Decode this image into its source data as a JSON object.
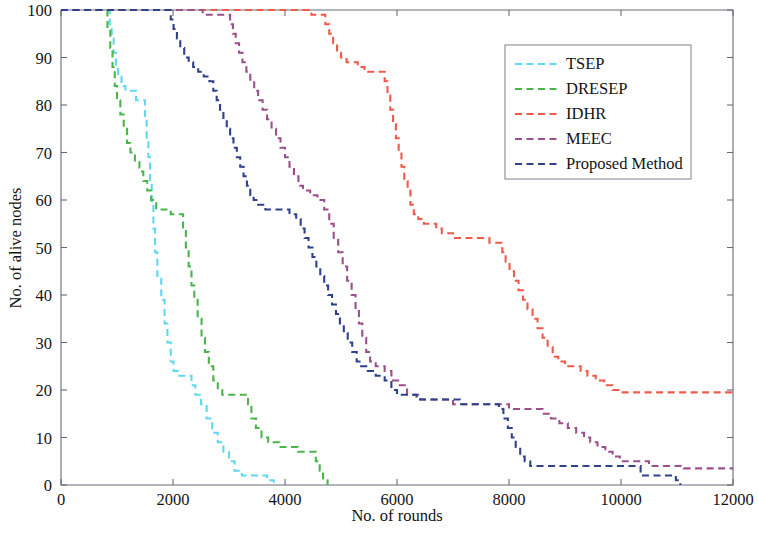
{
  "chart_data": {
    "type": "line",
    "title": "",
    "xlabel": "No. of rounds",
    "ylabel": "No. of alive nodes",
    "xlim": [
      0,
      12000
    ],
    "ylim": [
      0,
      100
    ],
    "xticks": [
      0,
      2000,
      4000,
      6000,
      8000,
      10000,
      12000
    ],
    "xtick_labels": [
      "0",
      "2000",
      "4000",
      "6000",
      "8000",
      "10000",
      "12000"
    ],
    "yticks": [
      0,
      10,
      20,
      30,
      40,
      50,
      60,
      70,
      80,
      90,
      100
    ],
    "ytick_labels": [
      "0",
      "10",
      "20",
      "30",
      "40",
      "50",
      "60",
      "70",
      "80",
      "90",
      "100"
    ],
    "grid": false,
    "legend_position": "upper right",
    "line_style": "dashed",
    "series": [
      {
        "name": "TSEP",
        "color": "#5fd8f0",
        "points": [
          [
            0,
            100
          ],
          [
            830,
            100
          ],
          [
            870,
            97
          ],
          [
            905,
            94
          ],
          [
            940,
            91
          ],
          [
            980,
            88
          ],
          [
            1020,
            86
          ],
          [
            1080,
            84
          ],
          [
            1150,
            83
          ],
          [
            1310,
            83
          ],
          [
            1340,
            81
          ],
          [
            1460,
            81
          ],
          [
            1500,
            77
          ],
          [
            1530,
            73
          ],
          [
            1560,
            69
          ],
          [
            1590,
            64
          ],
          [
            1620,
            59
          ],
          [
            1650,
            54
          ],
          [
            1680,
            49
          ],
          [
            1720,
            44
          ],
          [
            1790,
            39
          ],
          [
            1850,
            34
          ],
          [
            1900,
            30
          ],
          [
            1960,
            26
          ],
          [
            2010,
            24
          ],
          [
            2090,
            23
          ],
          [
            2280,
            23
          ],
          [
            2330,
            21
          ],
          [
            2400,
            19
          ],
          [
            2500,
            17
          ],
          [
            2600,
            14
          ],
          [
            2700,
            11
          ],
          [
            2800,
            9
          ],
          [
            2900,
            7
          ],
          [
            3000,
            5
          ],
          [
            3100,
            3
          ],
          [
            3230,
            2
          ],
          [
            3600,
            2
          ],
          [
            3680,
            1
          ],
          [
            3800,
            0
          ]
        ]
      },
      {
        "name": "DRESEP",
        "color": "#4ab54a",
        "points": [
          [
            0,
            100
          ],
          [
            780,
            100
          ],
          [
            830,
            96
          ],
          [
            880,
            92
          ],
          [
            920,
            88
          ],
          [
            960,
            84
          ],
          [
            1000,
            81
          ],
          [
            1060,
            78
          ],
          [
            1120,
            75
          ],
          [
            1180,
            72
          ],
          [
            1240,
            70
          ],
          [
            1320,
            68
          ],
          [
            1400,
            66
          ],
          [
            1470,
            64
          ],
          [
            1540,
            62
          ],
          [
            1610,
            60
          ],
          [
            1700,
            58
          ],
          [
            1920,
            58
          ],
          [
            1960,
            57
          ],
          [
            2120,
            57
          ],
          [
            2180,
            54
          ],
          [
            2230,
            50
          ],
          [
            2280,
            46
          ],
          [
            2330,
            42
          ],
          [
            2380,
            39
          ],
          [
            2440,
            35
          ],
          [
            2510,
            31
          ],
          [
            2570,
            28
          ],
          [
            2640,
            25
          ],
          [
            2720,
            22
          ],
          [
            2800,
            20
          ],
          [
            2880,
            19
          ],
          [
            3280,
            19
          ],
          [
            3340,
            17
          ],
          [
            3400,
            14
          ],
          [
            3480,
            12
          ],
          [
            3580,
            10
          ],
          [
            3700,
            9
          ],
          [
            3900,
            8
          ],
          [
            4150,
            8
          ],
          [
            4230,
            7
          ],
          [
            4480,
            7
          ],
          [
            4550,
            5
          ],
          [
            4620,
            3
          ],
          [
            4680,
            1
          ],
          [
            4760,
            0
          ]
        ]
      },
      {
        "name": "IDHR",
        "color": "#f05a4a",
        "points": [
          [
            0,
            100
          ],
          [
            4400,
            100
          ],
          [
            4470,
            99
          ],
          [
            4650,
            99
          ],
          [
            4720,
            97
          ],
          [
            4790,
            95
          ],
          [
            4860,
            93
          ],
          [
            4930,
            91
          ],
          [
            5000,
            90
          ],
          [
            5100,
            89
          ],
          [
            5300,
            88
          ],
          [
            5420,
            87
          ],
          [
            5700,
            87
          ],
          [
            5780,
            85
          ],
          [
            5830,
            82
          ],
          [
            5880,
            79
          ],
          [
            5930,
            76
          ],
          [
            5980,
            73
          ],
          [
            6030,
            70
          ],
          [
            6080,
            67
          ],
          [
            6130,
            64
          ],
          [
            6190,
            62
          ],
          [
            6240,
            59
          ],
          [
            6300,
            57
          ],
          [
            6380,
            56
          ],
          [
            6480,
            55
          ],
          [
            6700,
            54
          ],
          [
            6800,
            53
          ],
          [
            7000,
            52
          ],
          [
            7550,
            52
          ],
          [
            7650,
            51
          ],
          [
            7800,
            51
          ],
          [
            7880,
            49
          ],
          [
            7940,
            47
          ],
          [
            8010,
            45
          ],
          [
            8090,
            43
          ],
          [
            8170,
            41
          ],
          [
            8250,
            39
          ],
          [
            8330,
            37
          ],
          [
            8420,
            35
          ],
          [
            8510,
            33
          ],
          [
            8600,
            31
          ],
          [
            8690,
            29
          ],
          [
            8780,
            27
          ],
          [
            8880,
            26
          ],
          [
            9000,
            25
          ],
          [
            9180,
            25
          ],
          [
            9280,
            24
          ],
          [
            9400,
            23
          ],
          [
            9550,
            22
          ],
          [
            9700,
            21
          ],
          [
            9850,
            20
          ],
          [
            9980,
            19.5
          ],
          [
            10100,
            19.5
          ],
          [
            12000,
            19.5
          ]
        ]
      },
      {
        "name": "MEEC",
        "color": "#9b4f8c",
        "points": [
          [
            0,
            100
          ],
          [
            2480,
            100
          ],
          [
            2530,
            99
          ],
          [
            2950,
            99
          ],
          [
            3020,
            97
          ],
          [
            3070,
            95
          ],
          [
            3120,
            93
          ],
          [
            3180,
            91
          ],
          [
            3240,
            89
          ],
          [
            3310,
            87
          ],
          [
            3380,
            85
          ],
          [
            3450,
            83
          ],
          [
            3520,
            81
          ],
          [
            3600,
            79
          ],
          [
            3680,
            77
          ],
          [
            3760,
            75
          ],
          [
            3840,
            73
          ],
          [
            3920,
            71
          ],
          [
            4000,
            69
          ],
          [
            4080,
            67
          ],
          [
            4160,
            65
          ],
          [
            4240,
            63
          ],
          [
            4320,
            62
          ],
          [
            4450,
            61
          ],
          [
            4580,
            60
          ],
          [
            4700,
            58
          ],
          [
            4790,
            55
          ],
          [
            4870,
            52
          ],
          [
            4950,
            49
          ],
          [
            5030,
            46
          ],
          [
            5110,
            43
          ],
          [
            5190,
            40
          ],
          [
            5260,
            37
          ],
          [
            5320,
            34
          ],
          [
            5380,
            31
          ],
          [
            5450,
            28
          ],
          [
            5520,
            26
          ],
          [
            5620,
            25
          ],
          [
            5780,
            24
          ],
          [
            5900,
            22
          ],
          [
            6020,
            21
          ],
          [
            6180,
            19
          ],
          [
            6420,
            18
          ],
          [
            6800,
            18
          ],
          [
            7000,
            17
          ],
          [
            7900,
            17
          ],
          [
            8000,
            16
          ],
          [
            8500,
            16
          ],
          [
            8600,
            15
          ],
          [
            8750,
            14
          ],
          [
            8900,
            13
          ],
          [
            9050,
            12
          ],
          [
            9200,
            11
          ],
          [
            9340,
            10
          ],
          [
            9450,
            9
          ],
          [
            9580,
            8
          ],
          [
            9720,
            7
          ],
          [
            9850,
            6
          ],
          [
            9980,
            5
          ],
          [
            10100,
            5
          ],
          [
            10400,
            5
          ],
          [
            10500,
            4
          ],
          [
            11000,
            4
          ],
          [
            11120,
            3.5
          ],
          [
            12000,
            3.5
          ]
        ]
      },
      {
        "name": "Proposed Method",
        "color": "#30418c",
        "points": [
          [
            0,
            100
          ],
          [
            1900,
            100
          ],
          [
            1960,
            98
          ],
          [
            2010,
            96
          ],
          [
            2070,
            94
          ],
          [
            2130,
            92
          ],
          [
            2200,
            90
          ],
          [
            2280,
            89
          ],
          [
            2360,
            88
          ],
          [
            2450,
            87
          ],
          [
            2550,
            86
          ],
          [
            2650,
            85
          ],
          [
            2720,
            83
          ],
          [
            2780,
            81
          ],
          [
            2840,
            79
          ],
          [
            2900,
            77
          ],
          [
            2960,
            75
          ],
          [
            3020,
            73
          ],
          [
            3080,
            71
          ],
          [
            3140,
            69
          ],
          [
            3200,
            67
          ],
          [
            3260,
            65
          ],
          [
            3320,
            63
          ],
          [
            3380,
            61
          ],
          [
            3440,
            60
          ],
          [
            3520,
            59
          ],
          [
            3650,
            58
          ],
          [
            4000,
            58
          ],
          [
            4080,
            57
          ],
          [
            4200,
            56
          ],
          [
            4280,
            54
          ],
          [
            4350,
            52
          ],
          [
            4420,
            50
          ],
          [
            4490,
            48
          ],
          [
            4560,
            46
          ],
          [
            4630,
            44
          ],
          [
            4700,
            42
          ],
          [
            4770,
            40
          ],
          [
            4840,
            38
          ],
          [
            4910,
            36
          ],
          [
            4980,
            34
          ],
          [
            5050,
            32
          ],
          [
            5120,
            30
          ],
          [
            5200,
            28
          ],
          [
            5280,
            26
          ],
          [
            5360,
            25
          ],
          [
            5480,
            24
          ],
          [
            5620,
            23
          ],
          [
            5780,
            22
          ],
          [
            5900,
            20
          ],
          [
            6000,
            19
          ],
          [
            6200,
            19
          ],
          [
            6350,
            18
          ],
          [
            7000,
            18
          ],
          [
            7120,
            17
          ],
          [
            7750,
            17
          ],
          [
            7820,
            16
          ],
          [
            7900,
            14
          ],
          [
            7980,
            12
          ],
          [
            8050,
            10
          ],
          [
            8120,
            8
          ],
          [
            8200,
            6
          ],
          [
            8280,
            5
          ],
          [
            8380,
            4
          ],
          [
            10250,
            4
          ],
          [
            10350,
            2
          ],
          [
            10900,
            2
          ],
          [
            10980,
            1
          ],
          [
            11060,
            0
          ]
        ]
      }
    ]
  },
  "legend": {
    "entries": [
      {
        "label": "TSEP",
        "color": "#5fd8f0"
      },
      {
        "label": "DRESEP",
        "color": "#4ab54a"
      },
      {
        "label": "IDHR",
        "color": "#f05a4a"
      },
      {
        "label": "MEEC",
        "color": "#9b4f8c"
      },
      {
        "label": "Proposed Method",
        "color": "#30418c"
      }
    ]
  }
}
